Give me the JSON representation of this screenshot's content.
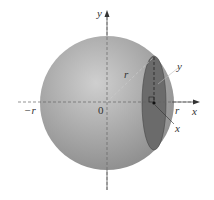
{
  "diagram": {
    "labels": {
      "y_axis": "y",
      "x_axis": "x",
      "origin": "0",
      "neg_r": "−r",
      "pos_r": "r",
      "radius": "r",
      "slice_y": "y",
      "slice_x": "x"
    },
    "colors": {
      "sphere_light": "#c8c8c8",
      "sphere_dark": "#8a8a8a",
      "section": "#6a6a6a",
      "axis": "#555555"
    }
  }
}
